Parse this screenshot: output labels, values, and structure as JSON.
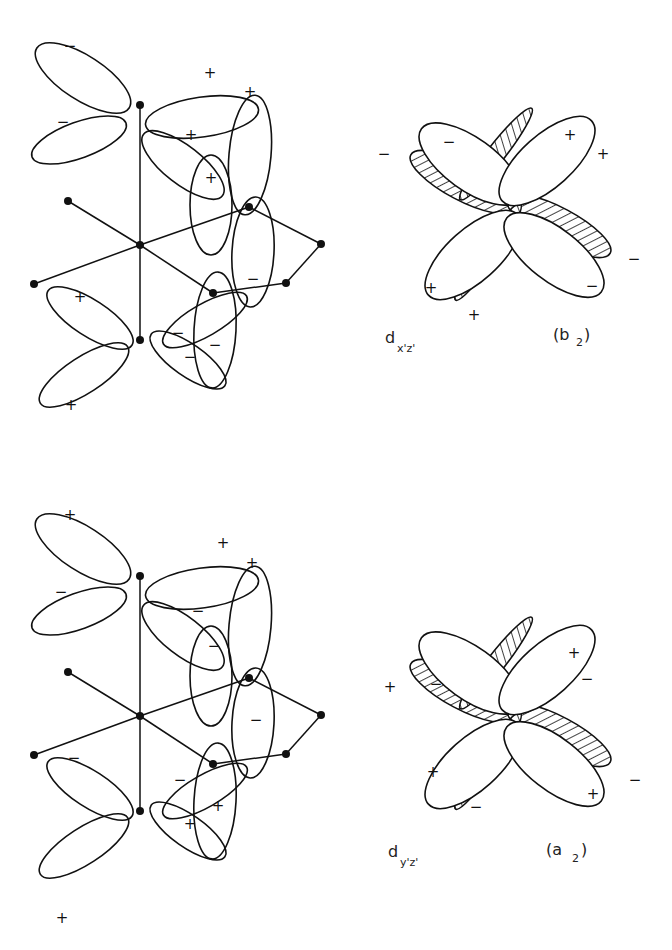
{
  "panels": [
    {
      "id": "top",
      "orbital_label": "d",
      "orbital_subscript": "x'z'",
      "symmetry_label": "(b",
      "symmetry_subscript": "2",
      "symmetry_close": ")",
      "left_signs": [
        "−",
        "−",
        "+",
        "+",
        "+",
        "+",
        "+",
        "−",
        "−",
        "−",
        "−",
        "+"
      ],
      "right_signs": [
        "−",
        "−",
        "+",
        "+",
        "+",
        "+",
        "−",
        "−"
      ]
    },
    {
      "id": "bottom",
      "orbital_label": "d",
      "orbital_subscript": "y'z'",
      "symmetry_label": "(a",
      "symmetry_subscript": "2",
      "symmetry_close": ")",
      "left_signs": [
        "+",
        "−",
        "+",
        "+",
        "−",
        "−",
        "−",
        "−",
        "−",
        "+",
        "+",
        "+"
      ],
      "right_signs": [
        "+",
        "−",
        "+",
        "−",
        "+",
        "−",
        "−",
        "+"
      ]
    }
  ],
  "colors": {
    "ink": "#111111",
    "background": "#ffffff"
  }
}
